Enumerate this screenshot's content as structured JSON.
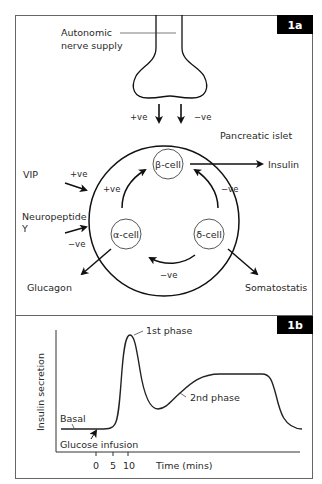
{
  "panel_a": {
    "tag": "1a",
    "nerve_label_line1": "Autonomic",
    "nerve_label_line2": "nerve supply",
    "nerve_pos": "+ve",
    "nerve_neg": "−ve",
    "islet_label": "Pancreatic islet",
    "beta_cell": "β-cell",
    "alpha_cell": "α-cell",
    "delta_cell": "δ-cell",
    "alpha_to_beta": "+ve",
    "delta_to_beta": "−ve",
    "delta_to_alpha": "−ve",
    "insulin": "Insulin",
    "glucagon": "Glucagon",
    "somatostatis": "Somatostatis",
    "vip": "VIP",
    "vip_effect": "+ve",
    "npy_line1": "Neuropeptide",
    "npy_line2": "Y",
    "npy_effect": "−ve"
  },
  "panel_b": {
    "tag": "1b",
    "ylabel": "Insulin secretion",
    "xlabel": "Time (mins)",
    "ticks": [
      "0",
      "5",
      "10"
    ],
    "first_phase": "1st phase",
    "second_phase": "2nd phase",
    "basal": "Basal",
    "glucose_infusion": "Glucose infusion"
  },
  "colors": {
    "line": "#1a1a1a",
    "border": "#555555",
    "tag_bg": "#000000"
  }
}
